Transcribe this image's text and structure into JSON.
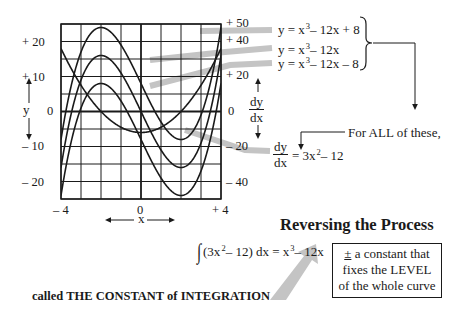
{
  "chart_data": {
    "type": "line",
    "title": "Reversing the Process",
    "x": {
      "label": "x",
      "range": [
        -4,
        4
      ],
      "ticks": [
        "– 4",
        "0",
        "+ 4"
      ],
      "tick_values": [
        -4,
        0,
        4
      ],
      "grid_step": 1
    },
    "y_left": {
      "label": "y",
      "range": [
        -25,
        25
      ],
      "ticks": [
        "+ 20",
        "+ 10",
        "0",
        "– 10",
        "– 20"
      ],
      "tick_values": [
        20,
        10,
        0,
        -10,
        -20
      ],
      "grid_step": 5
    },
    "y_right": {
      "label": "dy/dx",
      "range": [
        -50,
        50
      ],
      "ticks": [
        "+ 50",
        "+ 40",
        "+ 20",
        "0",
        "– 20",
        "– 40"
      ],
      "tick_values": [
        50,
        40,
        20,
        0,
        -20,
        -40
      ]
    },
    "grid": true,
    "series": [
      {
        "name": "y = x³ – 12x + 8",
        "axis": "left",
        "coeffs": [
          1,
          0,
          -12,
          8
        ],
        "x": [
          -4,
          -3,
          -2,
          -1,
          0,
          1,
          2,
          3,
          4
        ],
        "values": [
          -8,
          17,
          24,
          19,
          8,
          -3,
          -8,
          -1,
          24
        ]
      },
      {
        "name": "y = x³ – 12x",
        "axis": "left",
        "coeffs": [
          1,
          0,
          -12,
          0
        ],
        "x": [
          -4,
          -3,
          -2,
          -1,
          0,
          1,
          2,
          3,
          4
        ],
        "values": [
          -16,
          9,
          16,
          11,
          0,
          -11,
          -16,
          -9,
          16
        ]
      },
      {
        "name": "y = x³ – 12x – 8",
        "axis": "left",
        "coeffs": [
          1,
          0,
          -12,
          -8
        ],
        "x": [
          -4,
          -3,
          -2,
          -1,
          0,
          1,
          2,
          3,
          4
        ],
        "values": [
          -24,
          1,
          8,
          3,
          -8,
          -19,
          -24,
          -17,
          8
        ]
      },
      {
        "name": "dy/dx = 3x² – 12",
        "axis": "right",
        "coeffs": [
          0,
          3,
          0,
          -12
        ],
        "x": [
          -4,
          -3,
          -2,
          -1,
          0,
          1,
          2,
          3,
          4
        ],
        "values": [
          36,
          15,
          0,
          -9,
          -12,
          -9,
          0,
          15,
          36
        ]
      }
    ],
    "annotations": [
      "For ALL of these,",
      "∫(3x² – 12) dx = x³ – 12x",
      "± a constant that fixes the LEVEL of the whole curve",
      "called THE CONSTANT of INTEGRATION"
    ]
  },
  "colors": {
    "ink": "#1a1a1a",
    "leader": "#c4c4c4",
    "grid": "#1a1a1a",
    "background": "#ffffff"
  },
  "labels": {
    "y_axis": "y",
    "x_axis": "x",
    "dydx_num": "dy",
    "dydx_den": "dx",
    "eq1_lhs": "y = x",
    "eq1_rhs": "– 12x + 8",
    "eq2_lhs": "y = x",
    "eq2_rhs": "– 12x",
    "eq3_lhs": "y = x",
    "eq3_rhs": "– 12x – 8",
    "cube": "3",
    "square": "2",
    "for_all": "For ALL of these,",
    "deriv_num": "dy",
    "deriv_den": "dx",
    "deriv_rhs_a": "= 3x",
    "deriv_rhs_b": "– 12",
    "title": "Reversing the Process",
    "integral_sign": "∫",
    "integral_a": "(3x",
    "integral_b": "– 12) dx = x",
    "integral_c": "– 12x",
    "box_pm": "±",
    "box_line1": " a constant that",
    "box_line2": "fixes the LEVEL",
    "box_line3": "of the whole curve",
    "constant_caption": "called THE CONSTANT of INTEGRATION"
  }
}
